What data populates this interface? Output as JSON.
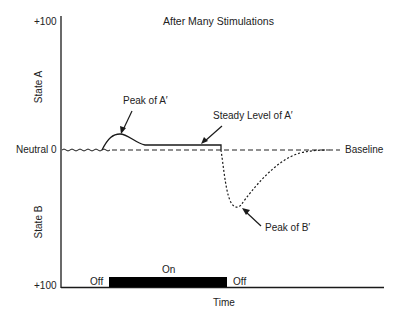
{
  "title": "After Many Stimulations",
  "y_axis": {
    "top_tick": "+100",
    "middle_tick": "Neutral 0",
    "bottom_tick": "+100",
    "upper_label": "State A",
    "lower_label": "State B"
  },
  "x_axis": {
    "label": "Time"
  },
  "stimulus": {
    "off_before": "Off",
    "on": "On",
    "off_after": "Off"
  },
  "annotations": {
    "peak_a": "Peak of A′",
    "steady_a": "Steady Level of A′",
    "peak_b": "Peak of B′",
    "baseline": "Baseline"
  },
  "colors": {
    "line": "#1a1a1a",
    "bar": "#000000",
    "background": "#ffffff"
  }
}
